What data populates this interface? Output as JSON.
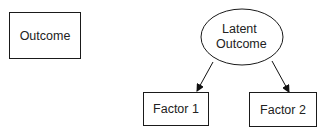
{
  "diagram": {
    "nodes": [
      {
        "id": "outcome",
        "label": "Outcome",
        "shape": "rectangle"
      },
      {
        "id": "latent",
        "label_lines": [
          "Latent",
          "Outcome"
        ],
        "shape": "ellipse"
      },
      {
        "id": "factor1",
        "label": "Factor 1",
        "shape": "rectangle"
      },
      {
        "id": "factor2",
        "label": "Factor 2",
        "shape": "rectangle"
      }
    ],
    "edges": [
      {
        "from": "latent",
        "to": "factor1",
        "type": "arrow"
      },
      {
        "from": "latent",
        "to": "factor2",
        "type": "arrow"
      }
    ],
    "colors": {
      "stroke": "#1a1a1a",
      "text": "#222222",
      "background": "#ffffff"
    }
  }
}
